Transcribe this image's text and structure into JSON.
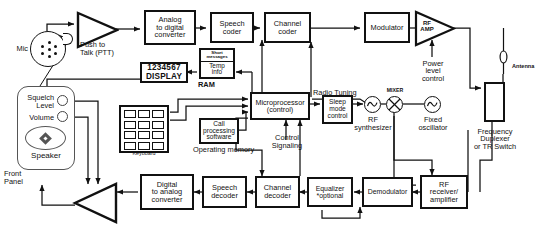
{
  "diagram": {
    "colors": {
      "line": "#111111",
      "panel_outline": "#555555",
      "background": "#ffffff"
    }
  },
  "input_section": {
    "mic_label": "Mic",
    "ptt_label": "Push to\nTalk (PTT)"
  },
  "transmit_chain": {
    "mic_amp": "",
    "adc": "Analog\nto digital\nconverter",
    "speech_coder": "Speech\ncoder",
    "channel_coder": "Channel\ncoder",
    "modulator": "Modulator",
    "rf_amp": "RF\nAMP",
    "power_level_control": "Power\nlevel\ncontrol"
  },
  "display_section": {
    "display_line1": "1234567",
    "display_line2": "DISPLAY",
    "ram_short_messages": "Short\nmessages",
    "ram_temp_info": "Temp\ninfo",
    "ram_label": "RAM"
  },
  "control_section": {
    "microprocessor": "Microprocessor\n(control)",
    "sleep_mode_control": "Sleep\nmode\ncontrol",
    "radio_tuning": "Radio Tuning",
    "control_signaling": "Control\nSignaling",
    "call_processing_software": "Call\nprocessing\nsoftware",
    "operating_memory": "Operating memory"
  },
  "front_panel": {
    "panel_label": "Front\nPanel",
    "squelch_level": "Squelch\nLevel",
    "volume": "Volume",
    "speaker": "Speaker",
    "keyboard_label": "Keyboard",
    "key_count": 12
  },
  "rf_section": {
    "rf_synthesizer": "RF\nsynthesizer",
    "mixer_label": "MIXER",
    "fixed_oscillator": "Fixed\noscillator",
    "duplexer": "Frequency\nDuplexer\nor TR Switch",
    "antenna_label": "Antenna"
  },
  "receive_chain": {
    "rf_receiver_amplifier": "RF\nreceiver/\namplifier",
    "demodulator": "Demodulator",
    "equalizer": "Equalizer\n*optional",
    "channel_decoder": "Channel\ndecoder",
    "speech_decoder": "Speech\ndecoder",
    "dac": "Digital\nto analog\nconverter",
    "audio_amp": ""
  },
  "icons": {
    "mic": "microphone-icon",
    "antenna": "antenna-icon",
    "amplifier": "triangle-amplifier-icon",
    "oscillator": "sine-oscillator-icon",
    "mixer": "mixer-cross-circle-icon",
    "speaker": "speaker-icon",
    "keypad": "keypad-icon"
  }
}
